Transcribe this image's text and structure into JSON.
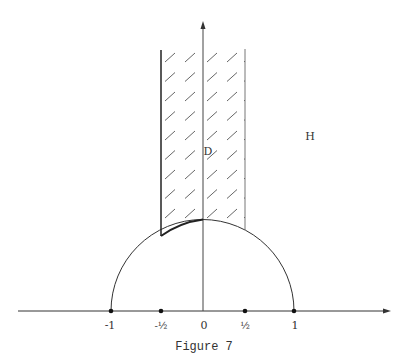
{
  "figure": {
    "caption": "Figure 7",
    "region_labels": {
      "strip": "D",
      "half_plane": "H"
    },
    "axis_ticks": [
      {
        "value": -1,
        "label": "-1"
      },
      {
        "value": -0.5,
        "label": "-½"
      },
      {
        "value": 0,
        "label": "0"
      },
      {
        "value": 0.5,
        "label": "½"
      },
      {
        "value": 1,
        "label": "1"
      }
    ],
    "colors": {
      "ink": "#333333",
      "background": "#ffffff"
    }
  }
}
